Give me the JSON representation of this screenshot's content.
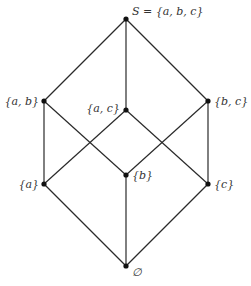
{
  "diagram": {
    "type": "hasse-diagram",
    "colors": {
      "edge": "#2a2a2a",
      "node": "#111111",
      "label": "#333333",
      "background": "#ffffff"
    },
    "nodes": [
      {
        "id": "S",
        "label": "S = {a, b, c}",
        "x": 126,
        "y": 19,
        "label_x": 132,
        "label_y": 15,
        "anchor": "start"
      },
      {
        "id": "ab",
        "label": "{a, b}",
        "x": 44,
        "y": 101,
        "label_x": 39,
        "label_y": 105,
        "anchor": "end"
      },
      {
        "id": "ac",
        "label": "{a, c}",
        "x": 126,
        "y": 110,
        "label_x": 120,
        "label_y": 112,
        "anchor": "end"
      },
      {
        "id": "bc",
        "label": "{b, c}",
        "x": 208,
        "y": 101,
        "label_x": 214,
        "label_y": 105,
        "anchor": "start"
      },
      {
        "id": "a",
        "label": "{a}",
        "x": 44,
        "y": 184,
        "label_x": 39,
        "label_y": 188,
        "anchor": "end"
      },
      {
        "id": "b",
        "label": "{b}",
        "x": 126,
        "y": 175,
        "label_x": 132,
        "label_y": 179,
        "anchor": "start"
      },
      {
        "id": "c",
        "label": "{c}",
        "x": 208,
        "y": 184,
        "label_x": 214,
        "label_y": 188,
        "anchor": "start"
      },
      {
        "id": "empty",
        "label": "∅",
        "x": 126,
        "y": 266,
        "label_x": 132,
        "label_y": 276,
        "anchor": "start"
      }
    ],
    "edges": [
      {
        "from": "S",
        "to": "ab"
      },
      {
        "from": "S",
        "to": "ac"
      },
      {
        "from": "S",
        "to": "bc"
      },
      {
        "from": "ab",
        "to": "a"
      },
      {
        "from": "ab",
        "to": "b"
      },
      {
        "from": "ac",
        "to": "a"
      },
      {
        "from": "ac",
        "to": "c"
      },
      {
        "from": "bc",
        "to": "b"
      },
      {
        "from": "bc",
        "to": "c"
      },
      {
        "from": "a",
        "to": "empty"
      },
      {
        "from": "b",
        "to": "empty"
      },
      {
        "from": "c",
        "to": "empty"
      }
    ]
  }
}
